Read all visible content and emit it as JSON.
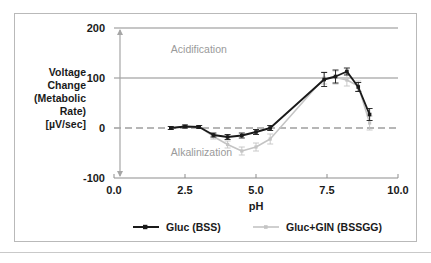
{
  "figure": {
    "frame_border_color": "#b9b9b9",
    "background": "#ffffff"
  },
  "chart_data": {
    "type": "line",
    "title": "",
    "xlabel": "pH",
    "ylabel_lines": [
      "Voltage",
      "Change",
      "(Metabolic",
      "Rate)",
      "[µV/sec]"
    ],
    "ylabel": "Voltage Change (Metabolic Rate) [µV/sec]",
    "xlim": [
      0.0,
      10.0
    ],
    "ylim": [
      -100,
      200
    ],
    "xticks": [
      0.0,
      2.5,
      5.0,
      7.5,
      10.0
    ],
    "xtick_labels": [
      "0.0",
      "2.5",
      "5.0",
      "7.5",
      "10.0"
    ],
    "yticks": [
      -100,
      0,
      100,
      200
    ],
    "ytick_labels": [
      "-100",
      "0",
      "100",
      "200"
    ],
    "grid": "horizontal-at-100-and-200; dashed-zero-line",
    "legend_position": "below-axes",
    "annotations": [
      {
        "text": "Acidification",
        "x": 2.0,
        "y": 150,
        "color": "#9a9a9a"
      },
      {
        "text": "Alkalinization",
        "x": 2.0,
        "y": -55,
        "color": "#9a9a9a"
      },
      {
        "text": "double-headed-arrow",
        "x": 0.5,
        "y_from": 200,
        "y_to": -100,
        "color": "#9a9a9a"
      }
    ],
    "series": [
      {
        "name": "Gluc (BSS)",
        "color": "#1a1a1a",
        "marker": "square",
        "x": [
          2.0,
          2.5,
          3.0,
          3.5,
          4.0,
          4.5,
          5.0,
          5.5,
          7.4,
          7.8,
          8.2,
          8.6,
          9.0
        ],
        "values": [
          0,
          3,
          2,
          -14,
          -18,
          -15,
          -8,
          0,
          97,
          103,
          113,
          82,
          27
        ],
        "errors": [
          3,
          3,
          3,
          4,
          5,
          5,
          5,
          5,
          14,
          13,
          7,
          9,
          12
        ]
      },
      {
        "name": "Gluc+GIN (BSSGG)",
        "color": "#c4c4c4",
        "marker": "square",
        "x": [
          2.0,
          2.5,
          3.0,
          3.5,
          4.0,
          4.5,
          5.0,
          5.5,
          7.4,
          7.8,
          8.2,
          8.6,
          9.0
        ],
        "values": [
          0,
          3,
          2,
          -17,
          -33,
          -46,
          -38,
          -22,
          100,
          101,
          96,
          84,
          10
        ],
        "errors": [
          3,
          3,
          3,
          5,
          7,
          8,
          8,
          10,
          12,
          13,
          12,
          10,
          14
        ]
      }
    ]
  },
  "legend": {
    "entries": [
      {
        "label": "Gluc (BSS)",
        "color": "#1a1a1a"
      },
      {
        "label": "Gluc+GIN (BSSGG)",
        "color": "#c4c4c4"
      }
    ]
  }
}
